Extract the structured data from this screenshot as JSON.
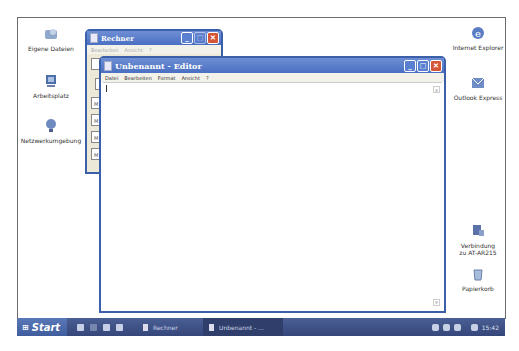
{
  "desktop": {
    "icons_left": [
      {
        "label": "Eigene Dateien",
        "icon": "my-documents-icon"
      },
      {
        "label": "Arbeitsplatz",
        "icon": "my-computer-icon"
      },
      {
        "label": "Netzwerkumgebung",
        "icon": "network-places-icon"
      }
    ],
    "icons_right": [
      {
        "label": "Internet Explorer",
        "icon": "internet-explorer-icon"
      },
      {
        "label": "Outlook Express",
        "icon": "outlook-express-icon"
      },
      {
        "label": "Verbindung zu AT-AR215",
        "icon": "network-connection-icon"
      },
      {
        "label": "Papierkorb",
        "icon": "recycle-bin-icon"
      }
    ]
  },
  "calculator": {
    "title": "Rechner",
    "menu": [
      "Bearbeiten",
      "Ansicht",
      "?"
    ],
    "memory_buttons": [
      "M",
      "M",
      "M",
      "M"
    ]
  },
  "editor": {
    "title": "Unbenannt - Editor",
    "menu": [
      "Datei",
      "Bearbeiten",
      "Format",
      "Ansicht",
      "?"
    ],
    "content": ""
  },
  "window_controls": {
    "minimize": "_",
    "maximize": "□",
    "close": "✕"
  },
  "taskbar": {
    "start_label": "Start",
    "buttons": [
      {
        "label": "Rechner"
      },
      {
        "label": "Unbenannt - ..."
      }
    ],
    "clock": "15:42"
  }
}
